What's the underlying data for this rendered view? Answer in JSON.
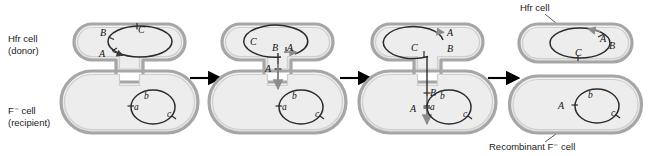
{
  "figure": {
    "type": "biology-process-diagram",
    "panel_count": 4,
    "arrow_count": 3
  },
  "row_labels": [
    {
      "name": "hfr-cell-donor",
      "line1": "Hfr cell",
      "line2": "(donor)"
    },
    {
      "name": "f-minus-cell-recipient",
      "line1": "F⁻ cell",
      "line2": "(recipient)"
    }
  ],
  "callouts": [
    {
      "name": "hfr-cell-callout",
      "text": "Hfr cell"
    },
    {
      "name": "recombinant-callout",
      "text": "Recombinant F⁻ cell"
    }
  ],
  "panels": [
    {
      "id": "panel-1",
      "stage": "conjugation bridge forms; donor chromosome intact",
      "donor_genes": [
        "B",
        "C",
        "A"
      ],
      "recipient_genes": [
        "a",
        "b",
        "c"
      ],
      "bridge_genes": []
    },
    {
      "id": "panel-2",
      "stage": "donor chromosome nicks and begins transfer through bridge",
      "donor_genes": [
        "C",
        "B",
        "A"
      ],
      "recipient_genes": [
        "a",
        "b",
        "c"
      ],
      "bridge_genes": [
        "A"
      ]
    },
    {
      "id": "panel-3",
      "stage": "strand continues transferring; A enters recipient",
      "donor_genes": [
        "A",
        "B",
        "C"
      ],
      "recipient_genes": [
        "a",
        "b",
        "c"
      ],
      "bridge_genes": [
        "B",
        "A"
      ]
    },
    {
      "id": "panel-4",
      "stage": "cells separate; recipient has recombined A gene",
      "donor_genes": [
        "A",
        "B",
        "C"
      ],
      "recipient_genes": [
        "A",
        "b",
        "c"
      ],
      "bridge_genes": []
    }
  ],
  "colors": {
    "cell_fill": "#ececec",
    "cell_wall": "#c9c9c9",
    "cell_outline": "#9a9a9a",
    "dna_stroke": "#2b2b2b",
    "arrow": "#000000",
    "transfer_strand": "#8c8c8c"
  }
}
